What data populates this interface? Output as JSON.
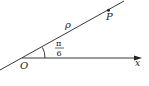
{
  "diagram": {
    "origin_label": "O",
    "point_label": "P",
    "radius_label": "ρ",
    "axis_label": "x",
    "angle_numerator": "π",
    "angle_denominator": "6",
    "colors": {
      "line": "#222222",
      "background": "#ffffff"
    }
  }
}
